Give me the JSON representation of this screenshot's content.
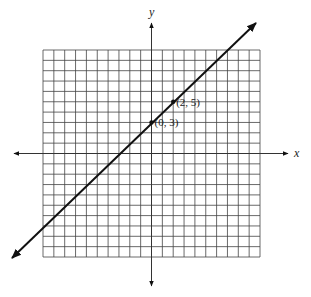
{
  "graph": {
    "axes": {
      "x_label": "x",
      "y_label": "y"
    },
    "grid": {
      "columns": 20,
      "rows": 20,
      "x_range": [
        -10,
        10
      ],
      "y_range": [
        -10,
        10
      ]
    },
    "line": {
      "equation": "y = x + 3",
      "slope": 1,
      "intercept": 3,
      "color": "#111111"
    },
    "points": [
      {
        "label": "(0, 3)",
        "x": 0,
        "y": 3
      },
      {
        "label": "(2, 5)",
        "x": 2,
        "y": 5
      }
    ]
  }
}
